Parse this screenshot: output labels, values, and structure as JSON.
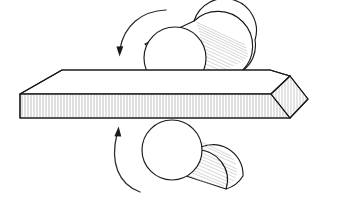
{
  "figure": {
    "title": "Rolling mill process diagram",
    "background_color": "#ffffff",
    "line_color": "#1a1a1a",
    "hatch_color": "#9a9a9a",
    "shade_color": "#b3b3b3",
    "width": 343,
    "height": 200
  },
  "parts": {
    "top_roll": {
      "label": "top-roll",
      "shape": "cylinder",
      "near_face": "circle",
      "axis_direction": "upper-right",
      "near_face_center_x": 175,
      "near_face_center_y": 58,
      "near_face_radius": 31,
      "far_face_center_x": 224,
      "far_face_center_y": 35,
      "far_face_radius": 31
    },
    "bottom_roll": {
      "label": "bottom-roll",
      "shape": "cylinder",
      "near_face": "circle",
      "axis_direction": "lower-right",
      "near_face_center_x": 172,
      "near_face_center_y": 150,
      "near_face_radius": 30,
      "far_face_center_x": 218,
      "far_face_center_y": 166,
      "far_face_radius": 30
    },
    "workpiece": {
      "label": "slab",
      "shape": "rectangular plate in perspective",
      "front_face_hatched": true,
      "end_face_hatched": true,
      "top_face_fill": "#ffffff",
      "left_edge_beveled": true,
      "front_top_y": 94,
      "front_bottom_y": 118,
      "left_x": 20,
      "right_x": 290
    }
  },
  "annotations": {
    "top_arrow": {
      "name": "top-roll-rotation-arrow",
      "meaning": "roll rotation direction",
      "direction": "clockwise",
      "head_position": "lower-left"
    },
    "bottom_arrow": {
      "name": "bottom-roll-rotation-arrow",
      "meaning": "roll rotation direction",
      "direction": "counter-clockwise",
      "head_position": "upper-left"
    }
  }
}
